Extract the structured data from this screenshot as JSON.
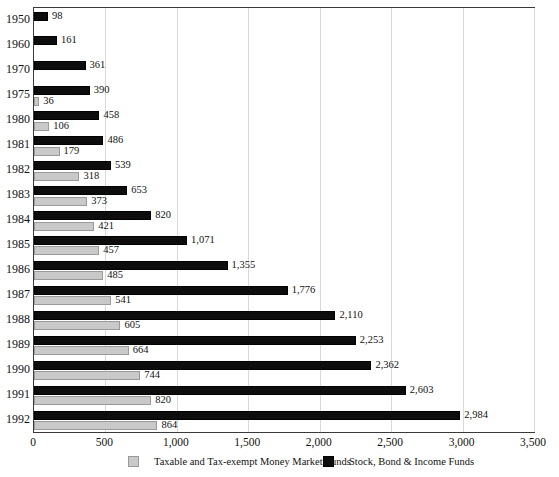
{
  "title_sliver": "Growth of Mutual Fund Assets",
  "chart_data": {
    "type": "bar",
    "title": "",
    "xlabel": "",
    "ylabel": "",
    "orientation": "horizontal",
    "grid": true,
    "xlim": [
      0,
      3500
    ],
    "xticks": [
      "0",
      "500",
      "1,000",
      "1,500",
      "2,000",
      "2,500",
      "3,000",
      "3,500"
    ],
    "xtick_values": [
      0,
      500,
      1000,
      1500,
      2000,
      2500,
      3000,
      3500
    ],
    "categories": [
      "1950",
      "1960",
      "1970",
      "1975",
      "1980",
      "1981",
      "1982",
      "1983",
      "1984",
      "1985",
      "1986",
      "1987",
      "1988",
      "1989",
      "1990",
      "1991",
      "1992"
    ],
    "legend_position": "bottom",
    "series": [
      {
        "name": "Stock, Bond & Income Funds",
        "color": "#0d0d0d",
        "values": [
          98,
          161,
          361,
          390,
          458,
          486,
          539,
          653,
          820,
          1071,
          1355,
          1776,
          2110,
          2253,
          2362,
          2603,
          2984
        ],
        "labels": [
          "98",
          "161",
          "361",
          "390",
          "458",
          "486",
          "539",
          "653",
          "820",
          "1,071",
          "1,355",
          "1,776",
          "2,110",
          "2,253",
          "2,362",
          "2,603",
          "2,984"
        ]
      },
      {
        "name": "Taxable and Tax-exempt Money Market Funds",
        "color": "#c9c9c9",
        "values": [
          null,
          null,
          null,
          36,
          106,
          179,
          318,
          373,
          421,
          457,
          485,
          541,
          605,
          664,
          744,
          820,
          864
        ],
        "labels": [
          "",
          "",
          "",
          "36",
          "106",
          "179",
          "318",
          "373",
          "421",
          "457",
          "485",
          "541",
          "605",
          "664",
          "744",
          "820",
          "864"
        ]
      }
    ]
  },
  "legend": {
    "items": [
      {
        "label": "Taxable and Tax-exempt Money Market Funds",
        "swatch": "gray"
      },
      {
        "label": "Stock, Bond & Income Funds",
        "swatch": "dark"
      }
    ]
  }
}
